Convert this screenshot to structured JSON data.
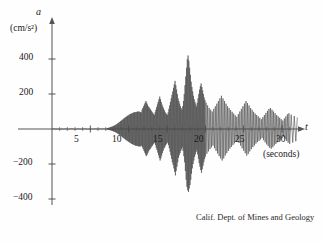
{
  "figure": {
    "credit": "Calif. Dept. of Mines and Geology",
    "y_axis_variable": "a",
    "y_axis_unit": "(cm/s²)",
    "x_axis_variable": "t",
    "x_axis_unit": "(seconds)"
  },
  "chart_data": {
    "type": "line",
    "title": "",
    "subtitle": "",
    "xlabel": "t (seconds)",
    "ylabel": "a (cm/s²)",
    "xlim": [
      0,
      33
    ],
    "ylim": [
      -460,
      470
    ],
    "grid": false,
    "legend": null,
    "annotations": [
      "Calif. Dept. of Mines and Geology"
    ],
    "x_ticks_major": [
      5,
      10,
      15,
      20,
      25,
      30
    ],
    "x_tick_labels": [
      "5",
      "10",
      "15",
      "20",
      "25",
      "30"
    ],
    "x_ticks_minor": [
      1,
      2,
      3,
      4,
      6,
      7,
      8,
      9,
      11,
      12,
      13,
      14,
      16,
      17,
      18,
      19,
      21,
      22,
      23,
      24,
      26,
      27,
      28,
      29,
      31
    ],
    "y_ticks_major": [
      -400,
      -200,
      200,
      400
    ],
    "y_tick_labels": [
      "−400",
      "−200",
      "200",
      "400"
    ],
    "series_name": "ground acceleration",
    "peak_acceleration": 420,
    "peak_time": 14.8,
    "min_acceleration": -360,
    "min_time": 15.0,
    "sample_interval": 0.05,
    "x": [
      0,
      0.05,
      0.1,
      0.15,
      0.2,
      0.25,
      0.3,
      0.35,
      0.4,
      0.45,
      0.5,
      0.55,
      0.6,
      0.65,
      0.7,
      0.75,
      0.8,
      0.85,
      0.9,
      0.95,
      1,
      1.05,
      1.1,
      1.15,
      1.2,
      1.25,
      1.3,
      1.35,
      1.4,
      1.45,
      1.5,
      1.55,
      1.6,
      1.65,
      1.7,
      1.75,
      1.8,
      1.85,
      1.9,
      1.95,
      2,
      2.05,
      2.1,
      2.15,
      2.2,
      2.25,
      2.3,
      2.35,
      2.4,
      2.45,
      2.5,
      2.55,
      2.6,
      2.65,
      2.7,
      2.75,
      2.8,
      2.85,
      2.9,
      2.95,
      3,
      3.05,
      3.1,
      3.15,
      3.2,
      3.25,
      3.3,
      3.35,
      3.4,
      3.45,
      3.5,
      3.55,
      3.6,
      3.65,
      3.7,
      3.75,
      3.8,
      3.85,
      3.9,
      3.95,
      4,
      4.05,
      4.1,
      4.15,
      4.2,
      4.25,
      4.3,
      4.35,
      4.4,
      4.45,
      4.5,
      4.55,
      4.6,
      4.65,
      4.7,
      4.75,
      4.8,
      4.85,
      4.9,
      4.95,
      5,
      5.05,
      5.1,
      5.15,
      5.2,
      5.25,
      5.3,
      5.35,
      5.4,
      5.45,
      5.5,
      5.55,
      5.6,
      5.65,
      5.7,
      5.75,
      5.8,
      5.85,
      5.9,
      5.95,
      6,
      6.05,
      6.1,
      6.15,
      6.2,
      6.25,
      6.3,
      6.35,
      6.4,
      6.45,
      6.5,
      6.55,
      6.6,
      6.65,
      6.7,
      6.75,
      6.8,
      6.85,
      6.9,
      6.95,
      7,
      7.05,
      7.1,
      7.15,
      7.2,
      7.25,
      7.3,
      7.35,
      7.4,
      7.45,
      7.5,
      7.55,
      7.6,
      7.65,
      7.7,
      7.75,
      7.8,
      7.85,
      7.9,
      7.95,
      8,
      8.05,
      8.1,
      8.15,
      8.2,
      8.25,
      8.3,
      8.35,
      8.4,
      8.45,
      8.5,
      8.55,
      8.6,
      8.65,
      8.7,
      8.75,
      8.8,
      8.85,
      8.9,
      8.95,
      9,
      9.05,
      9.1,
      9.15,
      9.2,
      9.25,
      9.3,
      9.35,
      9.4,
      9.45,
      9.5,
      9.55,
      9.6,
      9.65,
      9.7,
      9.75,
      9.8,
      9.85,
      9.9,
      9.95,
      10,
      10.05,
      10.1,
      10.15,
      10.2,
      10.25,
      10.3,
      10.35,
      10.4,
      10.45,
      10.5,
      10.55,
      10.6,
      10.65,
      10.7,
      10.75,
      10.8,
      10.85,
      10.9,
      10.95,
      11,
      11.05,
      11.1,
      11.15,
      11.2,
      11.25,
      11.3,
      11.35,
      11.4,
      11.45,
      11.5,
      11.55,
      11.6,
      11.65,
      11.7,
      11.75,
      11.8,
      11.85,
      11.9,
      11.95,
      12,
      12.05,
      12.1,
      12.15,
      12.2,
      12.25,
      12.3,
      12.35,
      12.4,
      12.45,
      12.5,
      12.55,
      12.6,
      12.65,
      12.7,
      12.75,
      12.8,
      12.85,
      12.9,
      12.95,
      13,
      13.05,
      13.1,
      13.15,
      13.2,
      13.25,
      13.3,
      13.35,
      13.4,
      13.45,
      13.5,
      13.55,
      13.6,
      13.65,
      13.7,
      13.75,
      13.8,
      13.85,
      13.9,
      13.95,
      14,
      14.05,
      14.1,
      14.15,
      14.2,
      14.25,
      14.3,
      14.35,
      14.4,
      14.45,
      14.5,
      14.55,
      14.6,
      14.65,
      14.7,
      14.75,
      14.8,
      14.85,
      14.9,
      14.95,
      15,
      15.05,
      15.1,
      15.15,
      15.2,
      15.25,
      15.3,
      15.35,
      15.4,
      15.45,
      15.5,
      15.55,
      15.6,
      15.65,
      15.7,
      15.75,
      15.8,
      15.85,
      15.9,
      15.95,
      16,
      16.05,
      16.1,
      16.15,
      16.2,
      16.25,
      16.3,
      16.35,
      16.4,
      16.45,
      16.5,
      16.55,
      16.6,
      16.65,
      16.7,
      16.75,
      16.8,
      16.85,
      16.9,
      16.95,
      17,
      17.05,
      17.1,
      17.15,
      17.2,
      17.25,
      17.3,
      17.35,
      17.4,
      17.45,
      17.5,
      17.55,
      17.6,
      17.65,
      17.7,
      17.75,
      17.8,
      17.85,
      17.9,
      17.95,
      18,
      18.05,
      18.1,
      18.15,
      18.2,
      18.25,
      18.3,
      18.35,
      18.4,
      18.45,
      18.5,
      18.55,
      18.6,
      18.65,
      18.7,
      18.75,
      18.8,
      18.85,
      18.9,
      18.95,
      19,
      19.05,
      19.1,
      19.15,
      19.2,
      19.25,
      19.3,
      19.35,
      19.4,
      19.45,
      19.5,
      19.55,
      19.6,
      19.65,
      19.7,
      19.75,
      19.8,
      19.85,
      19.9,
      19.95,
      20,
      20.1,
      20.2,
      20.3,
      20.4,
      20.5,
      20.6,
      20.7,
      20.8,
      20.9,
      21,
      21.1,
      21.2,
      21.3,
      21.4,
      21.5,
      21.6,
      21.7,
      21.8,
      21.9,
      22,
      22.1,
      22.2,
      22.3,
      22.4,
      22.5,
      22.6,
      22.7,
      22.8,
      22.9,
      23,
      23.1,
      23.2,
      23.3,
      23.4,
      23.5,
      23.6,
      23.7,
      23.8,
      23.9,
      24,
      24.1,
      24.2,
      24.3,
      24.4,
      24.5,
      24.6,
      24.7,
      24.8,
      24.9,
      25,
      25.1,
      25.2,
      25.3,
      25.4,
      25.5,
      25.6,
      25.7,
      25.8,
      25.9,
      26,
      26.1,
      26.2,
      26.3,
      26.4,
      26.5,
      26.6,
      26.7,
      26.8,
      26.9,
      27,
      27.1,
      27.2,
      27.3,
      27.4,
      27.5,
      27.6,
      27.7,
      27.8,
      27.9,
      28,
      28.1,
      28.2,
      28.3,
      28.4,
      28.5,
      28.6,
      28.7,
      28.8,
      28.9,
      29,
      29.1,
      29.2,
      29.3,
      29.4,
      29.5,
      29.6,
      29.7,
      29.8,
      29.9,
      30,
      30.1,
      30.2,
      30.3,
      30.4,
      30.5,
      30.6,
      30.7,
      30.8,
      30.9,
      31,
      31.2,
      31.4,
      31.6,
      31.8,
      32
    ],
    "y": [
      0,
      1,
      -1,
      0,
      2,
      -1,
      0,
      1,
      -2,
      1,
      0,
      -1,
      1,
      0,
      -1,
      2,
      0,
      -1,
      1,
      -1,
      0,
      1,
      0,
      -1,
      1,
      0,
      -2,
      1,
      0,
      1,
      -1,
      0,
      1,
      -1,
      0,
      2,
      -1,
      0,
      1,
      0,
      -1,
      1,
      0,
      -1,
      0,
      1,
      -1,
      0,
      1,
      -1,
      0,
      2,
      -1,
      0,
      1,
      -1,
      0,
      1,
      0,
      -1,
      1,
      0,
      -1,
      1,
      -2,
      0,
      1,
      0,
      -1,
      1,
      0,
      2,
      -1,
      0,
      -1,
      1,
      0,
      -1,
      1,
      0,
      2,
      -1,
      1,
      0,
      -1,
      1,
      -1,
      0,
      2,
      -1,
      0,
      1,
      0,
      -1,
      1,
      0,
      -2,
      1,
      0,
      1,
      -1,
      0,
      2,
      -1,
      1,
      -1,
      0,
      1,
      0,
      -1,
      2,
      0,
      -1,
      1,
      0,
      -1,
      1,
      0,
      2,
      -1,
      0,
      1,
      -1,
      2,
      -1,
      0,
      1,
      0,
      -2,
      1,
      0,
      -1,
      1,
      0,
      2,
      -1,
      0,
      1,
      -1,
      0,
      1,
      -2,
      0,
      3,
      -4,
      5,
      -3,
      6,
      -5,
      8,
      -6,
      9,
      -7,
      11,
      -9,
      12,
      -10,
      14,
      -11,
      16,
      -13,
      18,
      -15,
      20,
      -17,
      22,
      -19,
      25,
      -21,
      28,
      -24,
      31,
      -27,
      34,
      -30,
      38,
      -33,
      41,
      -36,
      45,
      -40,
      48,
      -43,
      52,
      -47,
      55,
      -50,
      59,
      -54,
      62,
      -57,
      66,
      -61,
      69,
      -64,
      72,
      -67,
      75,
      -70,
      78,
      -73,
      81,
      -76,
      84,
      -79,
      86,
      -82,
      88,
      -85,
      90,
      -87,
      92,
      -89,
      94,
      -91,
      95,
      -93,
      96,
      -95,
      97,
      -96,
      98,
      -97,
      99,
      -98,
      99,
      -99,
      100,
      -99,
      98,
      -100,
      96,
      -98,
      94,
      -96,
      110,
      -105,
      120,
      -115,
      130,
      -125,
      140,
      -135,
      150,
      -145,
      160,
      -155,
      150,
      -148,
      140,
      -138,
      130,
      -128,
      125,
      -120,
      118,
      -115,
      112,
      -108,
      105,
      -100,
      98,
      -95,
      92,
      -88,
      85,
      -82,
      80,
      -78,
      95,
      -92,
      110,
      -108,
      125,
      -120,
      140,
      -135,
      155,
      -150,
      170,
      -165,
      185,
      -180,
      170,
      -168,
      155,
      -152,
      140,
      -138,
      128,
      -125,
      118,
      -112,
      108,
      -105,
      98,
      -95,
      90,
      -88,
      85,
      -82,
      80,
      -76,
      95,
      -92,
      115,
      -110,
      135,
      -130,
      155,
      -150,
      175,
      -170,
      195,
      -190,
      215,
      -205,
      235,
      -225,
      255,
      -245,
      275,
      -265,
      250,
      -240,
      225,
      -215,
      200,
      -190,
      175,
      -165,
      160,
      -150,
      145,
      -138,
      130,
      -125,
      120,
      -115,
      110,
      -105,
      130,
      -125,
      160,
      -155,
      200,
      -190,
      250,
      -240,
      300,
      -290,
      350,
      -330,
      400,
      -350,
      420,
      -360,
      390,
      -340,
      350,
      -320,
      310,
      -290,
      270,
      -255,
      240,
      -225,
      215,
      -200,
      190,
      -180,
      170,
      -160,
      155,
      -145,
      140,
      -132,
      128,
      -120,
      150,
      -145,
      175,
      -170,
      200,
      -195,
      225,
      -215,
      245,
      -235,
      260,
      -250,
      240,
      -230,
      220,
      -210,
      200,
      -190,
      180,
      -172,
      165,
      -158,
      150,
      -142,
      135,
      -128,
      120,
      -115,
      110,
      -105,
      100,
      -95,
      115,
      -110,
      130,
      -125,
      145,
      -140,
      160,
      -155,
      175,
      -168,
      190,
      -180,
      175,
      -168,
      160,
      -152,
      145,
      -138,
      130,
      -125,
      120,
      -112,
      108,
      -102,
      98,
      -92,
      88,
      -82,
      78,
      -74,
      70,
      -66,
      85,
      -80,
      100,
      -95,
      115,
      -110,
      130,
      -124,
      145,
      -138,
      160,
      -152,
      148,
      -142,
      135,
      -128,
      120,
      -115,
      110,
      -104,
      98,
      -94,
      88,
      -84,
      80,
      -75,
      72,
      -68,
      64,
      -60,
      56,
      -52,
      68,
      -64,
      80,
      -76,
      92,
      -88,
      104,
      -98,
      115,
      -108,
      120,
      -112,
      110,
      -104,
      100,
      -94,
      90,
      -85,
      80,
      -76,
      72,
      -68,
      64,
      -60,
      56,
      -52,
      48,
      -44,
      60,
      -56,
      72,
      -68,
      84,
      -78,
      90,
      -85,
      82,
      -78,
      74,
      -70,
      66,
      -62,
      58,
      -54,
      70,
      -65,
      80,
      -75,
      72,
      -68,
      62,
      -58,
      68,
      -64,
      58,
      -54,
      62,
      -58,
      52,
      -48,
      58,
      -54,
      48,
      -44,
      55,
      -50,
      45,
      -42,
      50,
      -46,
      42,
      -38,
      48,
      -44,
      40,
      -36,
      44,
      -40,
      36,
      -33,
      40,
      -36,
      33,
      -30,
      36,
      -33,
      30,
      -27,
      33,
      -30,
      28,
      -25,
      30,
      -27,
      25,
      -22,
      28,
      -25,
      23,
      -20,
      26,
      -23,
      21,
      -18,
      24,
      -21,
      19,
      -17,
      22,
      -19,
      18,
      -16,
      20,
      -18,
      16,
      -14,
      18,
      -16,
      15,
      -13,
      17,
      -15,
      14,
      -12,
      15,
      -13,
      12,
      -11,
      14,
      -12,
      11,
      -10,
      13,
      -11,
      10,
      -9,
      12,
      -10,
      9,
      -8,
      11,
      -9,
      9,
      -8,
      10,
      -9,
      8,
      -7,
      9,
      -8,
      7,
      -6,
      8,
      -7,
      6,
      -5,
      7,
      -6,
      5,
      -4,
      6,
      -5,
      4,
      -3,
      4,
      -3,
      3,
      -2,
      3,
      -2
    ]
  }
}
